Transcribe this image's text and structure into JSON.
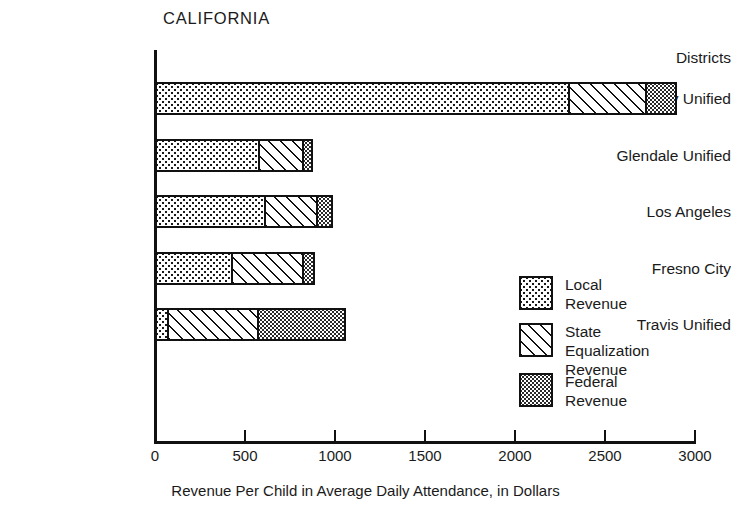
{
  "chart_data": {
    "type": "bar",
    "orientation": "horizontal",
    "stacked": true,
    "title": "CALIFORNIA",
    "xlabel": "Revenue Per Child in Average Daily Attendance, in Dollars",
    "ylabel": "Districts",
    "xlim": [
      0,
      3000
    ],
    "xticks": [
      0,
      500,
      1000,
      1500,
      2000,
      2500,
      3000
    ],
    "xtick_labels": [
      "0",
      "500",
      "1000",
      "1500",
      "2000",
      "2500",
      "3000"
    ],
    "grid": false,
    "legend_position": "center-right",
    "categories": [
      "Emory Unified",
      "Glendale Unified",
      "Los Angeles",
      "Fresno City",
      "Travis Unified"
    ],
    "series": [
      {
        "name": "Local Revenue",
        "pattern": "coarse-dots",
        "values": [
          2300,
          580,
          610,
          430,
          70
        ]
      },
      {
        "name": "State Equalization Revenue",
        "pattern": "diagonal-hatch",
        "values": [
          430,
          240,
          290,
          390,
          500
        ]
      },
      {
        "name": "Federal Revenue",
        "pattern": "fine-dots",
        "values": [
          170,
          60,
          90,
          70,
          490
        ]
      }
    ],
    "totals": [
      2900,
      880,
      990,
      890,
      1060
    ],
    "colors": {
      "ink": "#111111",
      "background": "#ffffff"
    }
  },
  "legend": {
    "items": [
      {
        "label": "Local Revenue",
        "pattern": "local"
      },
      {
        "label": "State Equalization\nRevenue",
        "pattern": "state"
      },
      {
        "label": "Federal Revenue",
        "pattern": "federal"
      }
    ]
  }
}
